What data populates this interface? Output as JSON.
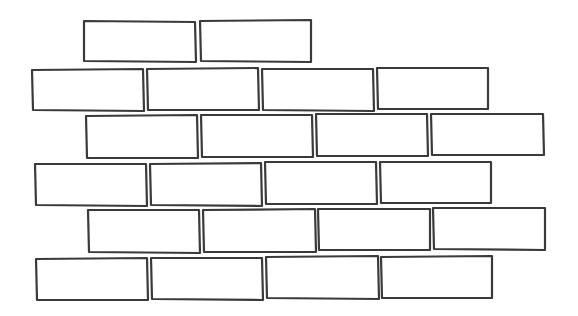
{
  "drawing": {
    "subject": "brick-wall-outline",
    "stroke_color": "#3a3a3a",
    "fill_color": "#ffffff",
    "background_color": "#ffffff",
    "rows": [
      {
        "bricks": [
          [
            84,
            21,
            195,
            22,
            196,
            62,
            84,
            61
          ],
          [
            200,
            21,
            311,
            20,
            311,
            62,
            201,
            61
          ]
        ]
      },
      {
        "bricks": [
          [
            32,
            70,
            143,
            69,
            144,
            111,
            33,
            110
          ],
          [
            147,
            69,
            258,
            68,
            259,
            110,
            148,
            110
          ],
          [
            262,
            69,
            373,
            69,
            374,
            111,
            263,
            110
          ],
          [
            377,
            68,
            488,
            68,
            488,
            109,
            378,
            109
          ]
        ]
      },
      {
        "bricks": [
          [
            86,
            116,
            197,
            115,
            198,
            158,
            87,
            158
          ],
          [
            201,
            115,
            312,
            115,
            313,
            157,
            202,
            157
          ],
          [
            316,
            114,
            427,
            114,
            428,
            156,
            317,
            156
          ],
          [
            431,
            114,
            543,
            114,
            544,
            155,
            432,
            155
          ]
        ]
      },
      {
        "bricks": [
          [
            35,
            164,
            146,
            164,
            147,
            206,
            36,
            205
          ],
          [
            150,
            164,
            261,
            163,
            262,
            206,
            151,
            205
          ],
          [
            265,
            162,
            376,
            162,
            377,
            204,
            266,
            204
          ],
          [
            380,
            162,
            491,
            162,
            491,
            203,
            381,
            203
          ]
        ]
      },
      {
        "bricks": [
          [
            88,
            210,
            199,
            210,
            200,
            253,
            89,
            252
          ],
          [
            203,
            210,
            315,
            209,
            316,
            252,
            204,
            252
          ],
          [
            318,
            209,
            430,
            209,
            430,
            250,
            319,
            250
          ],
          [
            433,
            208,
            545,
            208,
            545,
            250,
            434,
            249
          ]
        ]
      },
      {
        "bricks": [
          [
            36,
            259,
            147,
            258,
            148,
            300,
            37,
            300
          ],
          [
            151,
            258,
            262,
            258,
            263,
            300,
            152,
            299
          ],
          [
            266,
            257,
            378,
            256,
            379,
            299,
            267,
            298
          ],
          [
            381,
            257,
            492,
            256,
            492,
            298,
            382,
            298
          ]
        ]
      }
    ]
  }
}
